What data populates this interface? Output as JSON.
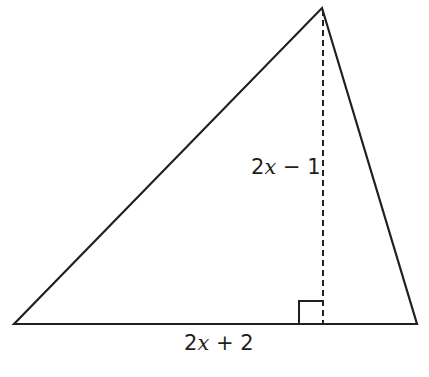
{
  "diagram": {
    "type": "triangle-with-altitude",
    "stroke_color": "#231f20",
    "vertices": {
      "apex": [
        322,
        8
      ],
      "left_base": [
        14,
        324
      ],
      "right_base": [
        417,
        324
      ]
    },
    "altitude": {
      "x": 323,
      "y_top": 8,
      "y_bottom": 324,
      "style": "dashed"
    },
    "right_angle_marker": {
      "x": 299,
      "y": 301,
      "size": 24
    },
    "labels": {
      "height": {
        "coef": "2",
        "var": "x",
        "rest": " − 1"
      },
      "base": {
        "coef": "2",
        "var": "x",
        "rest": " + 2"
      }
    }
  }
}
